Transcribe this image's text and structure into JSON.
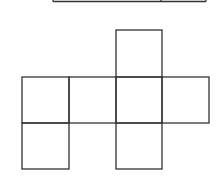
{
  "diagram": {
    "stroke_color": "#333333",
    "background": "#ffffff",
    "top_strip": {
      "x1": 53,
      "x2": 206,
      "y": 1.5,
      "divider_x": 161
    },
    "grid": {
      "cols_x": [
        22,
        69,
        116,
        162,
        209
      ],
      "rows_y": [
        30,
        77,
        123,
        169
      ]
    },
    "squares": [
      {
        "name": "top",
        "col": 2,
        "row": 0
      },
      {
        "name": "middle-left",
        "col": 0,
        "row": 1
      },
      {
        "name": "middle-center-left",
        "col": 1,
        "row": 1
      },
      {
        "name": "middle-center",
        "col": 2,
        "row": 1
      },
      {
        "name": "middle-right",
        "col": 3,
        "row": 1
      },
      {
        "name": "bottom-left",
        "col": 0,
        "row": 2
      },
      {
        "name": "bottom-center",
        "col": 2,
        "row": 2
      }
    ]
  }
}
